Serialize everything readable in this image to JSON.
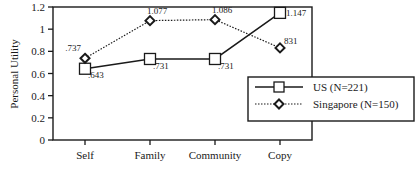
{
  "chart_data": {
    "type": "line",
    "title": "",
    "xlabel": "",
    "ylabel": "Personal Utility",
    "ylim": [
      0,
      1.2
    ],
    "yticks": [
      "0",
      "0.2",
      "0.4",
      "0.6",
      "0.8",
      "1",
      "1.2"
    ],
    "categories": [
      "Self",
      "Family",
      "Community",
      "Copy"
    ],
    "grid": false,
    "legend_position": "right-middle, overlapping plot edge",
    "series": [
      {
        "name": "US (N=221)",
        "marker": "square",
        "line_style": "solid",
        "values": [
          0.643,
          0.731,
          0.731,
          1.147
        ],
        "labels": [
          ".643",
          ".731",
          ".731",
          "1.147"
        ]
      },
      {
        "name": "Singapore (N=150)",
        "marker": "diamond",
        "line_style": "dotted",
        "values": [
          0.737,
          1.077,
          1.086,
          0.831
        ],
        "labels": [
          ".737",
          "1.077",
          "1.086",
          "831"
        ]
      }
    ]
  },
  "colors": {
    "ink": "#1a1a1a",
    "background": "#ffffff"
  }
}
